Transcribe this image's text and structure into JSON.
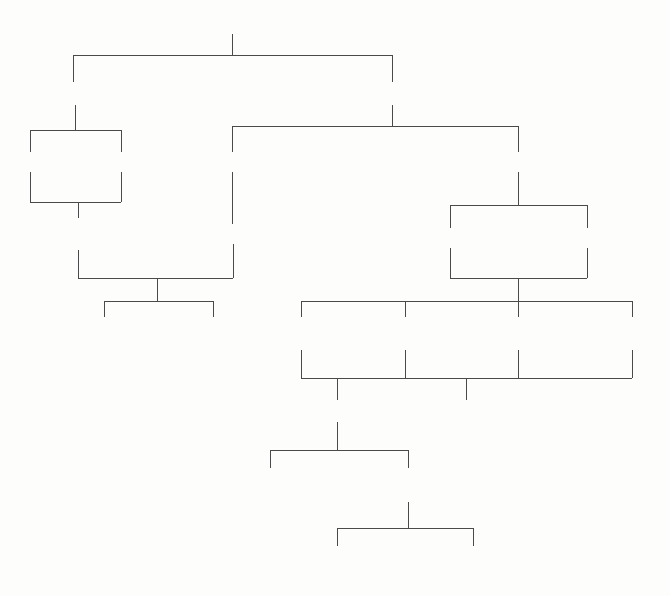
{
  "diagram": {
    "type": "tree",
    "nodes": [
      {
        "id": "root",
        "label": "hot water system choices",
        "lines": [
          "hot water system choices"
        ],
        "x": 232,
        "y": 20,
        "level": 0
      },
      {
        "id": "localised",
        "label": "localised",
        "lines": [
          "localised"
        ],
        "x": 75,
        "y": 91,
        "level": 1
      },
      {
        "id": "centralised",
        "label": "centralised",
        "lines": [
          "centralised"
        ],
        "x": 392,
        "y": 91,
        "level": 1
      },
      {
        "id": "loc-instant",
        "label": "instant",
        "lines": [
          "instant"
        ],
        "x": 33,
        "y": 161,
        "level": 2
      },
      {
        "id": "loc-storage",
        "label": "storage",
        "lines": [
          "storage"
        ],
        "x": 121,
        "y": 161,
        "level": 2
      },
      {
        "id": "cen-instant",
        "label": "instant",
        "lines": [
          "instant"
        ],
        "x": 232,
        "y": 161,
        "level": 2
      },
      {
        "id": "cen-storage",
        "label": "storage",
        "lines": [
          "storage"
        ],
        "x": 518,
        "y": 161,
        "level": 2
      },
      {
        "id": "single-point",
        "label": "single point",
        "lines": [
          "single",
          "point"
        ],
        "x": 78,
        "y": 226,
        "level": 3
      },
      {
        "id": "multi-point",
        "label": "multi-point",
        "lines": [
          "multi-point"
        ],
        "x": 233,
        "y": 232,
        "level": 3
      },
      {
        "id": "open-system",
        "label": "open system",
        "lines": [
          "open system"
        ],
        "x": 450,
        "y": 237,
        "level": 3
      },
      {
        "id": "unvented-system",
        "label": "unvented system",
        "lines": [
          "unvented system"
        ],
        "x": 587,
        "y": 237,
        "level": 3
      },
      {
        "id": "inlet-controlled",
        "label": "inlet controlled",
        "lines": [
          "inlet",
          "controlled"
        ],
        "x": 104,
        "y": 325,
        "level": 4
      },
      {
        "id": "outlet-controlled",
        "label": "outlet controlled",
        "lines": [
          "outlet",
          "controlled"
        ],
        "x": 213,
        "y": 325,
        "level": 4
      },
      {
        "id": "boiler-storage",
        "label": "boiler and storage system",
        "lines": [
          "boiler and",
          "storage system"
        ],
        "x": 304,
        "y": 325,
        "level": 4
      },
      {
        "id": "solar-heater",
        "label": "solar heater",
        "lines": [
          "solar",
          "heater"
        ],
        "x": 408,
        "y": 325,
        "level": 4
      },
      {
        "id": "gas-fired-heater",
        "label": "gas fired heater",
        "lines": [
          "gas fired",
          "heater"
        ],
        "x": 522,
        "y": 325,
        "level": 4
      },
      {
        "id": "electric-heater",
        "label": "electric heater",
        "lines": [
          "electric",
          "heater"
        ],
        "x": 635,
        "y": 325,
        "level": 4
      },
      {
        "id": "indirectly-heated",
        "label": "indirectly heated",
        "lines": [
          "indirectly heated"
        ],
        "x": 337,
        "y": 408,
        "level": 5
      },
      {
        "id": "directly-heated",
        "label": "directly heated",
        "lines": [
          "directly heated"
        ],
        "x": 466,
        "y": 408,
        "level": 5
      },
      {
        "id": "sealed-primary",
        "label": "sealed primary circuit",
        "lines": [
          "sealed primary",
          "circuit"
        ],
        "x": 270,
        "y": 477,
        "level": 6
      },
      {
        "id": "vented-primary",
        "label": "vented primary circuit",
        "lines": [
          "vented primary",
          "circuit"
        ],
        "x": 408,
        "y": 477,
        "level": 6
      },
      {
        "id": "double-feed",
        "label": "double feed system",
        "lines": [
          "double feed",
          "system"
        ],
        "x": 337,
        "y": 554,
        "level": 7
      },
      {
        "id": "single-feed",
        "label": "single feed system",
        "lines": [
          "single feed",
          "system"
        ],
        "x": 473,
        "y": 554,
        "level": 7
      }
    ],
    "edges": [
      {
        "from": "root",
        "to": [
          "localised",
          "centralised"
        ]
      },
      {
        "from": "localised",
        "to": [
          "loc-instant",
          "loc-storage"
        ]
      },
      {
        "from": "centralised",
        "to": [
          "cen-instant",
          "cen-storage"
        ]
      },
      {
        "from": "loc-instant+loc-storage",
        "to": [
          "single-point"
        ]
      },
      {
        "from": "cen-instant",
        "to": [
          "multi-point"
        ]
      },
      {
        "from": "cen-storage",
        "to": [
          "open-system",
          "unvented-system"
        ]
      },
      {
        "from": "single-point+multi-point",
        "to": [
          "inlet-controlled",
          "outlet-controlled"
        ]
      },
      {
        "from": "open-system+unvented-system",
        "to": [
          "boiler-storage",
          "solar-heater",
          "gas-fired-heater",
          "electric-heater"
        ]
      },
      {
        "from": "boiler-storage+solar-heater+gas-fired-heater+electric-heater",
        "to": [
          "indirectly-heated",
          "directly-heated"
        ]
      },
      {
        "from": "indirectly-heated",
        "to": [
          "sealed-primary",
          "vented-primary"
        ]
      },
      {
        "from": "vented-primary",
        "to": [
          "double-feed",
          "single-feed"
        ]
      }
    ],
    "lines": [
      {
        "name": "root-stem",
        "x1": 232,
        "y1": 34,
        "x2": 232,
        "y2": 55
      },
      {
        "name": "root-bar",
        "x1": 73,
        "y1": 55,
        "x2": 392,
        "y2": 55
      },
      {
        "name": "localised-riser",
        "x1": 73,
        "y1": 55,
        "x2": 73,
        "y2": 82
      },
      {
        "name": "centralised-riser",
        "x1": 392,
        "y1": 55,
        "x2": 392,
        "y2": 82
      },
      {
        "name": "localised-stem",
        "x1": 75,
        "y1": 105,
        "x2": 75,
        "y2": 130
      },
      {
        "name": "localised-bar",
        "x1": 30,
        "y1": 130,
        "x2": 121,
        "y2": 130
      },
      {
        "name": "loc-instant-riser",
        "x1": 30,
        "y1": 130,
        "x2": 30,
        "y2": 152
      },
      {
        "name": "loc-storage-riser",
        "x1": 121,
        "y1": 130,
        "x2": 121,
        "y2": 152
      },
      {
        "name": "centralised-stem",
        "x1": 392,
        "y1": 105,
        "x2": 392,
        "y2": 126
      },
      {
        "name": "centralised-bar",
        "x1": 232,
        "y1": 126,
        "x2": 518,
        "y2": 126
      },
      {
        "name": "cen-instant-riser",
        "x1": 232,
        "y1": 126,
        "x2": 232,
        "y2": 152
      },
      {
        "name": "cen-storage-riser",
        "x1": 518,
        "y1": 126,
        "x2": 518,
        "y2": 152
      },
      {
        "name": "loc-instant-drop",
        "x1": 30,
        "y1": 172,
        "x2": 30,
        "y2": 202
      },
      {
        "name": "loc-storage-drop",
        "x1": 121,
        "y1": 172,
        "x2": 121,
        "y2": 202
      },
      {
        "name": "single-point-bar",
        "x1": 30,
        "y1": 202,
        "x2": 121,
        "y2": 202
      },
      {
        "name": "single-point-stem",
        "x1": 78,
        "y1": 202,
        "x2": 78,
        "y2": 218
      },
      {
        "name": "multi-point-drop",
        "x1": 232,
        "y1": 172,
        "x2": 232,
        "y2": 224
      },
      {
        "name": "cen-storage-drop",
        "x1": 518,
        "y1": 172,
        "x2": 518,
        "y2": 205
      },
      {
        "name": "storage-split-bar",
        "x1": 450,
        "y1": 205,
        "x2": 587,
        "y2": 205
      },
      {
        "name": "open-system-riser",
        "x1": 450,
        "y1": 205,
        "x2": 450,
        "y2": 228
      },
      {
        "name": "unvented-riser",
        "x1": 587,
        "y1": 205,
        "x2": 587,
        "y2": 228
      },
      {
        "name": "single-point-drop",
        "x1": 78,
        "y1": 250,
        "x2": 78,
        "y2": 278
      },
      {
        "name": "multi-point-drop2",
        "x1": 233,
        "y1": 244,
        "x2": 233,
        "y2": 278
      },
      {
        "name": "point-merge-bar",
        "x1": 78,
        "y1": 278,
        "x2": 233,
        "y2": 278
      },
      {
        "name": "point-merge-stem",
        "x1": 157,
        "y1": 278,
        "x2": 157,
        "y2": 301
      },
      {
        "name": "controlled-bar",
        "x1": 104,
        "y1": 301,
        "x2": 213,
        "y2": 301
      },
      {
        "name": "inlet-riser",
        "x1": 104,
        "y1": 301,
        "x2": 104,
        "y2": 317
      },
      {
        "name": "outlet-riser",
        "x1": 213,
        "y1": 301,
        "x2": 213,
        "y2": 317
      },
      {
        "name": "open-system-drop",
        "x1": 450,
        "y1": 248,
        "x2": 450,
        "y2": 278
      },
      {
        "name": "unvented-drop",
        "x1": 587,
        "y1": 248,
        "x2": 587,
        "y2": 278
      },
      {
        "name": "storage-merge-bar",
        "x1": 450,
        "y1": 278,
        "x2": 587,
        "y2": 278
      },
      {
        "name": "storage-merge-stem",
        "x1": 518,
        "y1": 278,
        "x2": 518,
        "y2": 301
      },
      {
        "name": "heater-bar",
        "x1": 301,
        "y1": 301,
        "x2": 632,
        "y2": 301
      },
      {
        "name": "boiler-riser",
        "x1": 301,
        "y1": 301,
        "x2": 301,
        "y2": 317
      },
      {
        "name": "solar-riser",
        "x1": 405,
        "y1": 301,
        "x2": 405,
        "y2": 317
      },
      {
        "name": "gasfired-riser",
        "x1": 518,
        "y1": 301,
        "x2": 518,
        "y2": 317
      },
      {
        "name": "electric-riser",
        "x1": 632,
        "y1": 301,
        "x2": 632,
        "y2": 317
      },
      {
        "name": "boiler-drop",
        "x1": 301,
        "y1": 350,
        "x2": 301,
        "y2": 378
      },
      {
        "name": "solar-drop",
        "x1": 405,
        "y1": 350,
        "x2": 405,
        "y2": 378
      },
      {
        "name": "gasfired-drop",
        "x1": 518,
        "y1": 350,
        "x2": 518,
        "y2": 378
      },
      {
        "name": "electric-drop",
        "x1": 632,
        "y1": 350,
        "x2": 632,
        "y2": 378
      },
      {
        "name": "heater-merge-bar",
        "x1": 301,
        "y1": 378,
        "x2": 632,
        "y2": 378
      },
      {
        "name": "indirect-riser",
        "x1": 337,
        "y1": 378,
        "x2": 337,
        "y2": 400
      },
      {
        "name": "direct-riser",
        "x1": 466,
        "y1": 378,
        "x2": 466,
        "y2": 400
      },
      {
        "name": "indirect-stem",
        "x1": 337,
        "y1": 422,
        "x2": 337,
        "y2": 450
      },
      {
        "name": "primary-bar",
        "x1": 270,
        "y1": 450,
        "x2": 408,
        "y2": 450
      },
      {
        "name": "sealed-riser",
        "x1": 270,
        "y1": 450,
        "x2": 270,
        "y2": 468
      },
      {
        "name": "vented-riser",
        "x1": 408,
        "y1": 450,
        "x2": 408,
        "y2": 468
      },
      {
        "name": "vented-stem",
        "x1": 408,
        "y1": 502,
        "x2": 408,
        "y2": 528
      },
      {
        "name": "feed-bar",
        "x1": 337,
        "y1": 528,
        "x2": 473,
        "y2": 528
      },
      {
        "name": "double-feed-riser",
        "x1": 337,
        "y1": 528,
        "x2": 337,
        "y2": 546
      },
      {
        "name": "single-feed-riser",
        "x1": 473,
        "y1": 528,
        "x2": 473,
        "y2": 546
      }
    ],
    "colors": {
      "background": "#fdfdfc",
      "line": "#4a4a4a",
      "text": "#2e2e2e"
    }
  }
}
